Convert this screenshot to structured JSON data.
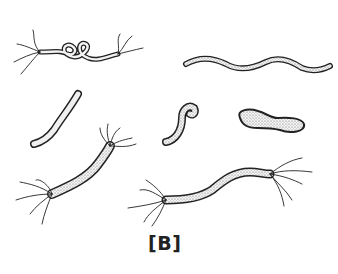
{
  "figure": {
    "label": "[B]",
    "colors": {
      "outline": "#222222",
      "fill": "#f2f2f2",
      "stipple": "#555555",
      "background": "#ffffff"
    },
    "organisms": [
      {
        "id": "coiled-flagellated",
        "shape": "coiled rod with bipolar flagella"
      },
      {
        "id": "wavy-spiral",
        "shape": "long wavy spiral"
      },
      {
        "id": "short-curved-rod",
        "shape": "curved rod"
      },
      {
        "id": "hooked-rod",
        "shape": "hook / comma form"
      },
      {
        "id": "dumbbell",
        "shape": "club / dumbbell form"
      },
      {
        "id": "curved-flagellated",
        "shape": "curved rod with bipolar flagella tufts"
      },
      {
        "id": "s-shaped-flagellated",
        "shape": "S-shaped rod with bipolar flagella tufts"
      }
    ]
  }
}
